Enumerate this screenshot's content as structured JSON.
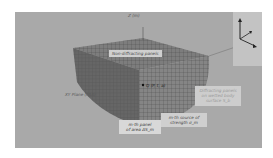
{
  "figure": {
    "labels": {
      "z_axis": "Z (m)",
      "non_diffracting": "Non-diffracting panels",
      "point": "Q (P, t, a)",
      "xy_plane": "XY Plane (FAA)",
      "diffracting_line1": "Diffracting panels",
      "diffracting_line2": "on wetted body",
      "diffracting_line3": "surface S_b",
      "mth_panel_line1": "m-th panel",
      "mth_panel_line2": "of area ΔS_m",
      "mth_source_line1": "m-th source of",
      "mth_source_line2": "strength σ_m"
    },
    "axes_icon": {
      "up": "z",
      "right": "x",
      "diag": "y"
    },
    "colors": {
      "background": "#a9a9a9",
      "mesh_dark": "#5c5c5c",
      "mesh_light": "#7a7a7a",
      "label_box": "#d0d0d0"
    }
  }
}
